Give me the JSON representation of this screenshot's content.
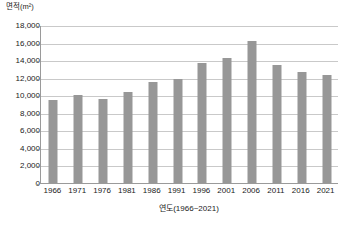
{
  "chart_data": {
    "type": "bar",
    "title": "",
    "xlabel": "연도(1966~2021)",
    "ylabel": "면적(m²)",
    "categories": [
      "1966",
      "1971",
      "1976",
      "1981",
      "1986",
      "1991",
      "1996",
      "2001",
      "2006",
      "2011",
      "2016",
      "2021"
    ],
    "values": [
      9500,
      10000,
      9600,
      10400,
      11500,
      11900,
      13700,
      14200,
      16200,
      13400,
      12700,
      12300
    ],
    "ylim": [
      0,
      18000
    ],
    "y_ticks": [
      0,
      2000,
      4000,
      6000,
      8000,
      10000,
      12000,
      14000,
      16000,
      18000
    ],
    "y_tick_labels": [
      "0",
      "2,000",
      "4,000",
      "6,000",
      "8,000",
      "10,000",
      "12,000",
      "14,000",
      "16,000",
      "18,000"
    ],
    "grid": true,
    "legend": "none",
    "series_color": "#979797",
    "gridline_color": "#c9c9c9",
    "axis_color": "#9a9a9a",
    "background": "#ffffff"
  }
}
